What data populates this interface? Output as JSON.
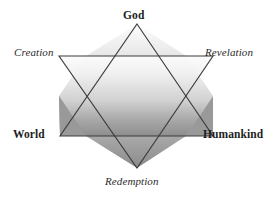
{
  "figure": {
    "name": "hexagram-theology-diagram",
    "background_color": "#ffffff",
    "outline_color": "#3a3a3a",
    "labels": {
      "top": "God",
      "upper_left": "Creation",
      "upper_right": "Revelation",
      "lower_left": "World",
      "lower_right": "Humankind",
      "bottom": "Redemption"
    },
    "shapes": {
      "upward_triangle": {
        "name": "upward-triangle",
        "points": "137,24 213,136 60,136",
        "vertices": [
          "God",
          "Humankind",
          "World"
        ],
        "fill_top_color": "#f2f2f2",
        "fill_bottom_color": "#8f8f8f"
      },
      "downward_triangle": {
        "name": "downward-triangle",
        "points": "59,56 213,56 137,168",
        "vertices": [
          "Creation",
          "Revelation",
          "Redemption"
        ],
        "fill_top_color": "#f4f4f4",
        "fill_bottom_color": "#8b8b8b"
      }
    },
    "colors": {
      "ink": "#1d1d1d",
      "stroke": "#3a3a3a",
      "light_gray": "#f2f2f2",
      "mid_gray": "#9a9a9a",
      "dark_gray": "#7d7d7d"
    }
  }
}
